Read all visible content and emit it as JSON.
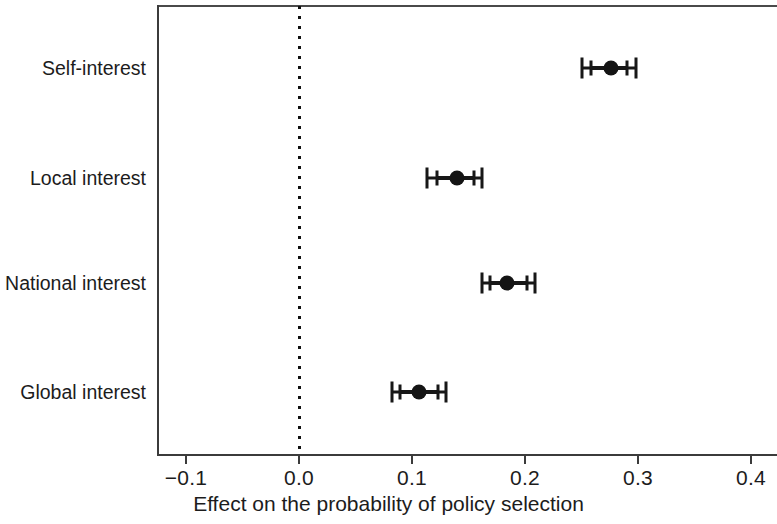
{
  "chart_data": {
    "type": "scatter",
    "subtype": "coefficient-plot-with-error-bars",
    "title": "",
    "xlabel": "Effect on the probability of policy selection",
    "ylabel": "",
    "categories": [
      "Self-interest",
      "Local interest",
      "National interest",
      "Global interest"
    ],
    "xlim": [
      -0.13,
      0.42
    ],
    "xticks": [
      -0.1,
      0.0,
      0.1,
      0.2,
      0.3,
      0.4
    ],
    "xticklabels": [
      "−0.1",
      "0.0",
      "0.1",
      "0.2",
      "0.3",
      "0.4"
    ],
    "grid": false,
    "legend": null,
    "reference_line": {
      "x": 0.0,
      "style": "dotted",
      "color": "#111111"
    },
    "point_color": "#141414",
    "series": [
      {
        "name": "Estimated effect",
        "points": [
          {
            "category": "Self-interest",
            "estimate": 0.276,
            "ci_outer_low": 0.25,
            "ci_outer_high": 0.298,
            "ci_inner_low": 0.258,
            "ci_inner_high": 0.29
          },
          {
            "category": "Local interest",
            "estimate": 0.14,
            "ci_outer_low": 0.113,
            "ci_outer_high": 0.162,
            "ci_inner_low": 0.122,
            "ci_inner_high": 0.155
          },
          {
            "category": "National interest",
            "estimate": 0.184,
            "ci_outer_low": 0.162,
            "ci_outer_high": 0.209,
            "ci_inner_low": 0.169,
            "ci_inner_high": 0.202
          },
          {
            "category": "Global interest",
            "estimate": 0.106,
            "ci_outer_low": 0.082,
            "ci_outer_high": 0.13,
            "ci_inner_low": 0.089,
            "ci_inner_high": 0.123
          }
        ]
      }
    ]
  }
}
